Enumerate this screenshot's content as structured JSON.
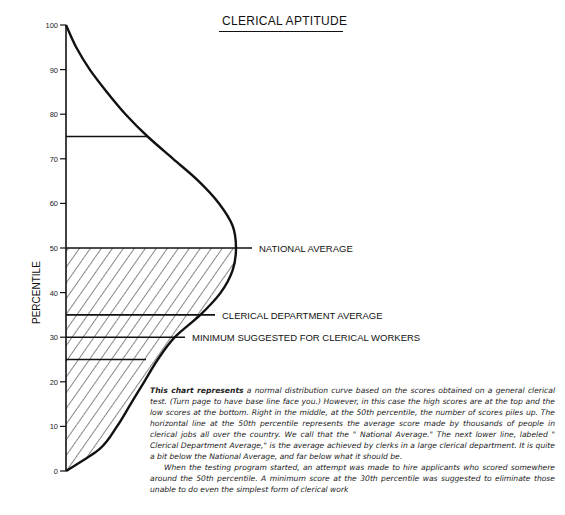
{
  "chart_data": {
    "type": "line",
    "title": "CLERICAL APTITUDE",
    "xlabel": "",
    "ylabel": "PERCENTILE",
    "ylim": [
      0,
      100
    ],
    "yticks": [
      0,
      10,
      20,
      30,
      40,
      50,
      60,
      70,
      80,
      90,
      100
    ],
    "orientation": "vertical-distribution",
    "curve": {
      "name": "normal distribution of scores",
      "percentile": [
        0,
        5,
        10,
        15,
        20,
        25,
        30,
        35,
        40,
        45,
        50,
        55,
        60,
        65,
        70,
        75,
        80,
        85,
        90,
        95,
        100
      ],
      "relative_frequency": [
        0.0,
        0.2,
        0.3,
        0.38,
        0.46,
        0.54,
        0.64,
        0.79,
        0.91,
        0.98,
        1.0,
        0.98,
        0.9,
        0.78,
        0.63,
        0.48,
        0.35,
        0.24,
        0.14,
        0.06,
        0.0
      ]
    },
    "shaded_region": {
      "from": 0,
      "to": 50,
      "pattern": "diagonal-hatch"
    },
    "reference_lines": [
      {
        "percentile": 75,
        "label": ""
      },
      {
        "percentile": 50,
        "label": "NATIONAL AVERAGE"
      },
      {
        "percentile": 35,
        "label": "CLERICAL DEPARTMENT AVERAGE"
      },
      {
        "percentile": 30,
        "label": "MINIMUM SUGGESTED FOR CLERICAL WORKERS"
      },
      {
        "percentile": 25,
        "label": ""
      }
    ],
    "grid": false,
    "legend": "none"
  },
  "caption": {
    "lead": "This chart represents",
    "p1": " a normal distribution curve based on the scores obtained on a general clerical test. (Turn page to have base line face you.) However, in this case the high scores are at the top and the low scores at the bottom. Right in the middle, at the 50th percentile, the number of scores piles up. The horizontal line at the 50th percentile represents the average score made by thousands of people in clerical jobs all over the country.  We call that the \" National Average.\" The next lower line, labeled \" Clerical Department Average,\" is the average achieved by clerks in a large clerical department.  It is quite a bit below the National Average, and far below what it should be.",
    "p2": "When the testing program started, an attempt was made to hire applicants who scored somewhere around the 50th percentile. A minimum score at the 30th percentile was suggested to eliminate those unable to do even the simplest form of clerical work"
  }
}
